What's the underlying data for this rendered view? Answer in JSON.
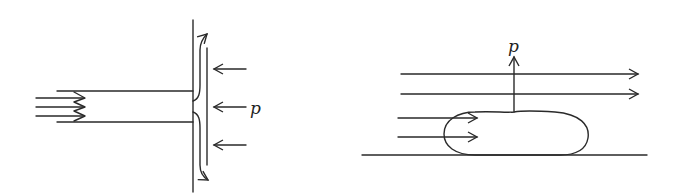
{
  "figure": {
    "panels": [
      {
        "id": "left",
        "description": "Jet impinging normally on a flat plate; flow splits and turns along the plate; pressure p acts on the plate",
        "label": "p"
      },
      {
        "id": "right",
        "description": "Flow over a bump/body on a wall; streamlines pass over it; pressure p acts upward on the body",
        "label": "p"
      }
    ],
    "colors": {
      "line": "#2a2a2a",
      "background": "#ffffff"
    }
  }
}
